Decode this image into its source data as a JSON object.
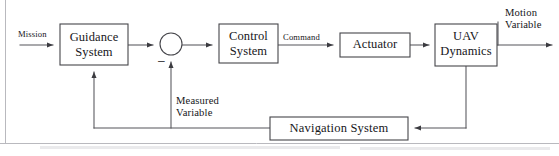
{
  "diagram": {
    "type": "control-system-block-diagram",
    "colors": {
      "stroke": "#45454a",
      "wire": "#55555a",
      "arrow": "#3b3b40",
      "background": "#ffffff",
      "text": "#16161a"
    },
    "blocks": [
      {
        "id": "guidance",
        "label_line1": "Guidance",
        "label_line2": "System",
        "x": 60,
        "y": 24,
        "w": 68,
        "h": 41
      },
      {
        "id": "control",
        "label_line1": "Control",
        "label_line2": "System",
        "x": 219,
        "y": 24,
        "w": 59,
        "h": 39
      },
      {
        "id": "actuator",
        "label_line1": "Actuator",
        "label_line2": "",
        "x": 340,
        "y": 33,
        "w": 70,
        "h": 24
      },
      {
        "id": "uav",
        "label_line1": "UAV",
        "label_line2": "Dynamics",
        "x": 435,
        "y": 24,
        "w": 62,
        "h": 42
      },
      {
        "id": "navigation",
        "label_line1": "Navigation System",
        "label_line2": "",
        "x": 270,
        "y": 117,
        "w": 138,
        "h": 23
      }
    ],
    "summing_junction": {
      "id": "sum",
      "cx": 171,
      "cy": 44,
      "r": 11,
      "sign": "–",
      "sign_name": "minus-sign"
    },
    "signals": [
      {
        "id": "mission",
        "label": "Mission",
        "x": 18,
        "y": 30
      },
      {
        "id": "command",
        "label": "Command",
        "x": 283,
        "y": 33
      },
      {
        "id": "motion_variable",
        "label_line1": "Motion",
        "label_line2": "Variable",
        "x": 505,
        "y": 8
      },
      {
        "id": "measured_variable",
        "label_line1": "Measured",
        "label_line2": "Variable",
        "x": 175,
        "y": 96
      }
    ]
  }
}
